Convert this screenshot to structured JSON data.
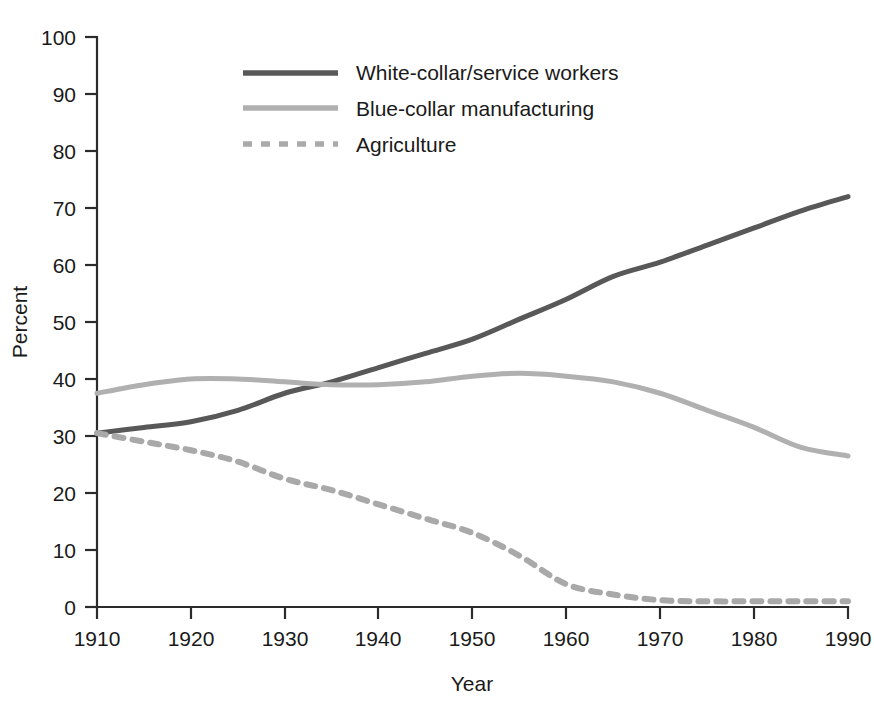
{
  "chart_data": {
    "type": "line",
    "title": "",
    "xlabel": "Year",
    "ylabel": "Percent",
    "xlim": [
      1910,
      1990
    ],
    "ylim": [
      0,
      100
    ],
    "xticks": [
      1910,
      1920,
      1930,
      1940,
      1950,
      1960,
      1970,
      1980,
      1990
    ],
    "yticks": [
      0,
      10,
      20,
      30,
      40,
      50,
      60,
      70,
      80,
      90,
      100
    ],
    "grid": false,
    "legend_position": "top-center",
    "x": [
      1910,
      1915,
      1920,
      1925,
      1930,
      1935,
      1940,
      1945,
      1950,
      1955,
      1960,
      1965,
      1970,
      1975,
      1980,
      1985,
      1990
    ],
    "series": [
      {
        "name": "White-collar/service workers",
        "style": "solid",
        "color": "#585858",
        "values": [
          30.5,
          31.5,
          32.5,
          34.5,
          37.5,
          39.5,
          42.0,
          44.5,
          47.0,
          50.5,
          54.0,
          58.0,
          60.5,
          63.5,
          66.5,
          69.5,
          72.0
        ]
      },
      {
        "name": "Blue-collar manufacturing",
        "style": "solid",
        "color": "#b0b0b0",
        "values": [
          37.5,
          39.0,
          40.0,
          40.0,
          39.5,
          39.0,
          39.0,
          39.5,
          40.5,
          41.0,
          40.5,
          39.5,
          37.5,
          34.5,
          31.5,
          28.0,
          26.5
        ]
      },
      {
        "name": "Agriculture",
        "style": "dashed",
        "color": "#a9a9a9",
        "values": [
          30.5,
          29.0,
          27.5,
          25.5,
          22.5,
          20.5,
          18.0,
          15.5,
          13.0,
          9.0,
          4.0,
          2.2,
          1.2,
          1.0,
          1.0,
          1.0,
          1.0
        ]
      }
    ]
  },
  "axis": {
    "y_title": "Percent",
    "x_title": "Year",
    "y_tick_labels": [
      "0",
      "10",
      "20",
      "30",
      "40",
      "50",
      "60",
      "70",
      "80",
      "90",
      "100"
    ],
    "x_tick_labels": [
      "1910",
      "1920",
      "1930",
      "1940",
      "1950",
      "1960",
      "1970",
      "1980",
      "1990"
    ]
  },
  "legend": {
    "items": [
      {
        "label": "White-collar/service workers",
        "color": "#585858",
        "style": "solid"
      },
      {
        "label": "Blue-collar manufacturing",
        "color": "#b0b0b0",
        "style": "solid"
      },
      {
        "label": "Agriculture",
        "color": "#a9a9a9",
        "style": "dashed"
      }
    ]
  },
  "colors": {
    "background": "#ffffff",
    "axis": "#2b2b2b",
    "text": "#1a1a1a",
    "white_collar": "#585858",
    "blue_collar": "#b0b0b0",
    "agriculture": "#a9a9a9"
  }
}
